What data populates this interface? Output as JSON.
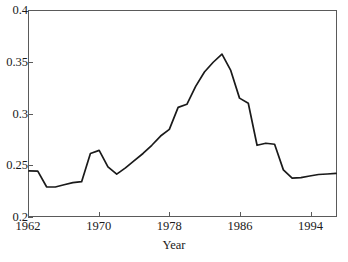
{
  "chart_data": {
    "type": "line",
    "title": "",
    "xlabel": "Year",
    "ylabel": "",
    "xlim": [
      1962,
      1997
    ],
    "ylim": [
      0.2,
      0.4
    ],
    "grid": false,
    "legend": null,
    "x_ticks": [
      1962,
      1970,
      1978,
      1986,
      1994
    ],
    "y_ticks": [
      0.2,
      0.25,
      0.3,
      0.35,
      0.4
    ],
    "y_tick_labels": [
      "0.2",
      "0.25",
      "0.3",
      "0.35",
      "0.4"
    ],
    "x_tick_labels": [
      "1962",
      "1970",
      "1978",
      "1986",
      "1994"
    ],
    "series": [
      {
        "name": "series-1",
        "color": "#1a1a1a",
        "x": [
          1962,
          1963,
          1964,
          1965,
          1966,
          1967,
          1968,
          1969,
          1970,
          1971,
          1972,
          1973,
          1974,
          1975,
          1976,
          1977,
          1978,
          1979,
          1980,
          1981,
          1982,
          1983,
          1984,
          1985,
          1986,
          1987,
          1988,
          1989,
          1990,
          1991,
          1992,
          1993,
          1994,
          1995,
          1996,
          1997
        ],
        "values": [
          0.244,
          0.2438,
          0.2285,
          0.2283,
          0.2305,
          0.2325,
          0.2335,
          0.261,
          0.264,
          0.248,
          0.2408,
          0.247,
          0.254,
          0.261,
          0.269,
          0.278,
          0.2845,
          0.306,
          0.309,
          0.3265,
          0.3405,
          0.35,
          0.358,
          0.342,
          0.315,
          0.31,
          0.269,
          0.271,
          0.27,
          0.245,
          0.237,
          0.2375,
          0.239,
          0.2405,
          0.241,
          0.2415
        ]
      }
    ],
    "annotations": []
  },
  "axis": {
    "x_title": "Year",
    "frame_color": "#5a5a5a"
  },
  "top_clipped_text": "",
  "colors": {
    "line": "#1a1a1a",
    "frame": "#5a5a5a",
    "background": "#ffffff"
  }
}
